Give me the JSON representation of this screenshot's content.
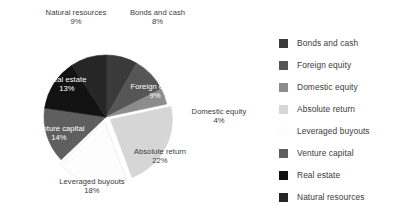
{
  "chart_data": {
    "type": "pie",
    "title": "",
    "subtitle": "",
    "xlabel": "",
    "ylabel": "",
    "units": "percent",
    "start_angle_deg": 0,
    "direction": "clockwise",
    "legend_position": "right",
    "grid": false,
    "background_color": "#ffffff",
    "categories": [
      "Bonds and cash",
      "Foreign equity",
      "Domestic equity",
      "Absolute return",
      "Leveraged buyouts",
      "Venture capital",
      "Real estate",
      "Natural resources"
    ],
    "values": [
      8,
      9,
      4,
      22,
      18,
      14,
      13,
      9
    ],
    "value_labels": [
      "8%",
      "9%",
      "4%",
      "22%",
      "18%",
      "14%",
      "13%",
      "9%"
    ],
    "colors": [
      "#3a3a3a",
      "#565656",
      "#8c8c8c",
      "#d6d6d6",
      "#fdfdfd",
      "#5f5f5f",
      "#121212",
      "#262626"
    ],
    "slices": [
      {
        "label": "Bonds and cash",
        "value": 8,
        "value_label": "8%",
        "color": "#3a3a3a",
        "label_placement": "outside",
        "exploded": false
      },
      {
        "label": "Foreign equity",
        "value": 9,
        "value_label": "9%",
        "color": "#565656",
        "label_placement": "inside",
        "exploded": false
      },
      {
        "label": "Domestic equity",
        "value": 4,
        "value_label": "4%",
        "color": "#8c8c8c",
        "label_placement": "outside",
        "exploded": false
      },
      {
        "label": "Absolute return",
        "value": 22,
        "value_label": "22%",
        "color": "#d6d6d6",
        "label_placement": "inside",
        "exploded": true
      },
      {
        "label": "Leveraged buyouts",
        "value": 18,
        "value_label": "18%",
        "color": "#fdfdfd",
        "label_placement": "outside",
        "exploded": true
      },
      {
        "label": "Venture capital",
        "value": 14,
        "value_label": "14%",
        "color": "#5f5f5f",
        "label_placement": "inside",
        "exploded": false
      },
      {
        "label": "Real estate",
        "value": 13,
        "value_label": "13%",
        "color": "#121212",
        "label_placement": "inside",
        "exploded": false
      },
      {
        "label": "Natural resources",
        "value": 9,
        "value_label": "9%",
        "color": "#262626",
        "label_placement": "outside",
        "exploded": false
      }
    ]
  },
  "legend": {
    "items": [
      {
        "label": "Bonds and cash",
        "color": "#3a3a3a"
      },
      {
        "label": "Foreign equity",
        "color": "#565656"
      },
      {
        "label": "Domestic equity",
        "color": "#8c8c8c"
      },
      {
        "label": "Absolute return",
        "color": "#d6d6d6"
      },
      {
        "label": "Leveraged buyouts",
        "color": "#fdfdfd"
      },
      {
        "label": "Venture capital",
        "color": "#5f5f5f"
      },
      {
        "label": "Real estate",
        "color": "#121212"
      },
      {
        "label": "Natural resources",
        "color": "#262626"
      }
    ]
  },
  "labels": {
    "natural_resources_name": "Natural resources",
    "natural_resources_value": "9%",
    "bonds_and_cash_name": "Bonds and cash",
    "bonds_and_cash_value": "8%",
    "foreign_equity_name": "Foreign equity",
    "foreign_equity_value": "9%",
    "domestic_equity_name": "Domestic equity",
    "domestic_equity_value": "4%",
    "absolute_return_name": "Absolute return",
    "absolute_return_value": "22%",
    "leveraged_buyouts_name": "Leveraged buyouts",
    "leveraged_buyouts_value": "18%",
    "venture_capital_name": "Venture capital",
    "venture_capital_value": "14%",
    "real_estate_name": "Real estate",
    "real_estate_value": "13%"
  }
}
